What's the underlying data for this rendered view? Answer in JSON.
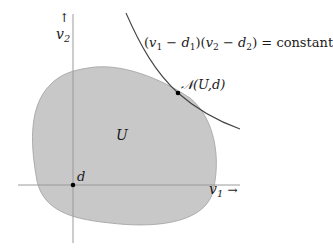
{
  "diagram": {
    "region_label": "U",
    "point_d_label": "d",
    "tangent_point_label": "𝒩(U,d)",
    "axes": {
      "x_label": "v",
      "x_sub": "1",
      "x_arrow": "→",
      "y_label": "v",
      "y_sub": "2",
      "y_arrow": "↑"
    },
    "curve_equation": {
      "p1_open": "(",
      "v1": "v",
      "v1_sub": "1",
      "minus1": " − ",
      "d1": "d",
      "d1_sub": "1",
      "p1_close": ")",
      "p2_open": "(",
      "v2": "v",
      "v2_sub": "2",
      "minus2": " − ",
      "d2": "d",
      "d2_sub": "2",
      "p2_close": ")",
      "equals": " = ",
      "rhs": "constant"
    },
    "colors": {
      "region_fill": "#c8c8c8",
      "region_stroke": "#9a9a9a",
      "axis": "#9a9a9a",
      "curve": "#444444",
      "point": "#000000"
    }
  }
}
